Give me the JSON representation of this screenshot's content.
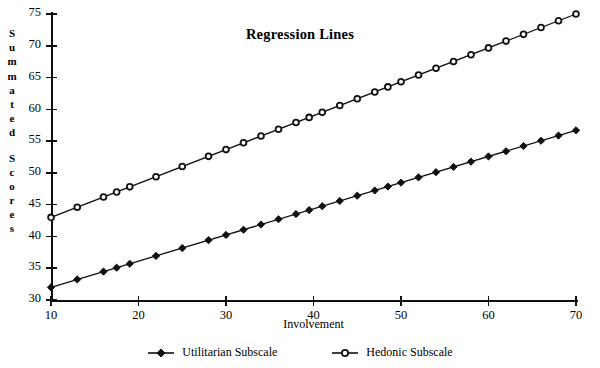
{
  "chart_data": {
    "type": "line",
    "title": "Regression Lines",
    "xlabel": "Involvement",
    "ylabel": "Summated Scores",
    "xlim": [
      10,
      70
    ],
    "ylim": [
      30,
      75
    ],
    "xticks": [
      10,
      20,
      30,
      40,
      50,
      60,
      70
    ],
    "yticks": [
      30,
      35,
      40,
      45,
      50,
      55,
      60,
      65,
      70,
      75
    ],
    "grid": false,
    "legend_position": "bottom",
    "x": [
      10,
      13,
      16,
      17.5,
      19,
      22,
      25,
      28,
      30,
      32,
      34,
      36,
      38,
      39.5,
      41,
      43,
      45,
      47,
      48.5,
      50,
      52,
      54,
      56,
      58,
      60,
      62,
      64,
      66,
      68,
      70
    ],
    "series": [
      {
        "name": "Utilitarian Subscale",
        "marker": "filled-diamond",
        "color": "#101010",
        "values": [
          32.0,
          33.8,
          35.0,
          35.3,
          35.8,
          36.7,
          37.9,
          38.9,
          39.6,
          40.3,
          41.0,
          41.7,
          42.5,
          43.0,
          43.5,
          44.3,
          45.0,
          45.8,
          46.3,
          46.9,
          47.6,
          48.3,
          49.1,
          49.8,
          50.6,
          51.3,
          52.0,
          52.8,
          53.5,
          54.2
        ],
        "endpoints": {
          "x_start": 10,
          "y_start": 32.0,
          "x_end": 70,
          "y_end": 56.7
        }
      },
      {
        "name": "Hedonic Subscale",
        "marker": "open-circle",
        "color": "#101010",
        "values": [
          43.0,
          44.8,
          46.5,
          47.2,
          47.9,
          49.1,
          50.2,
          51.5,
          52.3,
          53.1,
          53.9,
          54.7,
          55.5,
          56.1,
          56.7,
          57.5,
          58.3,
          59.1,
          59.7,
          60.3,
          61.1,
          61.9,
          62.7,
          63.5,
          64.3,
          65.1,
          65.9,
          66.7,
          67.5,
          68.3
        ],
        "endpoints": {
          "x_start": 10,
          "y_start": 43.0,
          "x_end": 70,
          "y_end": 75.0
        }
      }
    ]
  },
  "legend": {
    "items": [
      {
        "label": "Utilitarian Subscale",
        "marker": "filled-diamond"
      },
      {
        "label": "Hedonic Subscale",
        "marker": "open-circle"
      }
    ]
  },
  "axis_title_letters": {
    "y": [
      "S",
      "u",
      "m",
      "m",
      "a",
      "t",
      "e",
      "d",
      "",
      "S",
      "c",
      "o",
      "r",
      "e",
      "s"
    ]
  }
}
